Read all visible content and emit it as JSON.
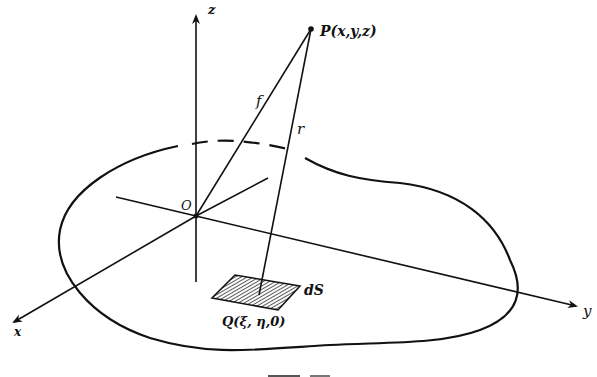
{
  "diagram": {
    "type": "3d-coordinate-geometry",
    "labels": {
      "z_axis": "z",
      "y_axis": "y",
      "x_axis": "x",
      "origin": "O",
      "point_p": "P(x,y,z)",
      "point_q": "Q(ξ, η,0)",
      "segment_f": "f",
      "segment_r": "r",
      "area_element": "dS"
    },
    "colors": {
      "ink": "#111111",
      "background": "#ffffff"
    }
  }
}
